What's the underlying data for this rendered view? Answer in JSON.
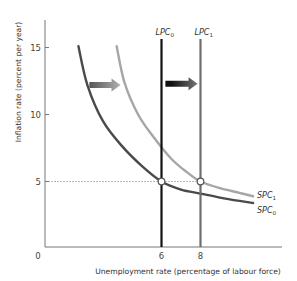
{
  "chart_data": {
    "type": "line",
    "title": "",
    "xlabel": "Unemployment rate (percentage of labour force)",
    "ylabel": "Inflation rate (percent per year)",
    "xlim": [
      0,
      12.2
    ],
    "ylim": [
      0,
      17.1
    ],
    "origin_label": "0",
    "x_ticks": [
      {
        "value": 6,
        "label": "6"
      },
      {
        "value": 8,
        "label": "8"
      }
    ],
    "y_ticks": [
      {
        "value": 5,
        "label": "5"
      },
      {
        "value": 10,
        "label": "10"
      },
      {
        "value": 15,
        "label": "15"
      }
    ],
    "grid": false,
    "series": [
      {
        "name": "SPC0",
        "label_main": "SPC",
        "label_sub": "0",
        "kind": "short-run phillips curve",
        "color": "#4a4a4a",
        "points": [
          [
            1.74,
            15.1
          ],
          [
            2.2,
            12.2
          ],
          [
            3.0,
            9.5
          ],
          [
            4.0,
            7.6
          ],
          [
            5.0,
            6.15
          ],
          [
            6.0,
            5.0
          ],
          [
            7.0,
            4.4
          ],
          [
            8.0,
            4.1
          ],
          [
            9.0,
            3.8
          ],
          [
            10.0,
            3.55
          ],
          [
            10.7,
            3.4
          ]
        ]
      },
      {
        "name": "SPC1",
        "label_main": "SPC",
        "label_sub": "1",
        "kind": "short-run phillips curve",
        "color": "#a6a6a6",
        "points": [
          [
            3.7,
            15.1
          ],
          [
            4.1,
            12.4
          ],
          [
            4.8,
            10.0
          ],
          [
            5.6,
            8.3
          ],
          [
            6.5,
            6.7
          ],
          [
            7.3,
            5.7
          ],
          [
            8.0,
            5.0
          ],
          [
            9.0,
            4.5
          ],
          [
            10.0,
            4.15
          ],
          [
            10.7,
            3.9
          ]
        ]
      },
      {
        "name": "LPC0",
        "label_main": "LPC",
        "label_sub": "0",
        "kind": "long-run phillips curve",
        "color": "#111111",
        "x": 6
      },
      {
        "name": "LPC1",
        "label_main": "LPC",
        "label_sub": "1",
        "kind": "long-run phillips curve",
        "color": "#6e6e6e",
        "x": 8
      }
    ],
    "reference_lines": [
      {
        "type": "horizontal-dotted",
        "y": 5,
        "x_from": 0,
        "x_to": 8
      }
    ],
    "markers": [
      {
        "name": "equilibrium-0",
        "x": 6,
        "y": 5
      },
      {
        "name": "equilibrium-1",
        "x": 8,
        "y": 5
      }
    ],
    "annotations": [
      {
        "type": "shift-arrow",
        "target": "SPC",
        "from_x": 2.3,
        "to_x": 3.9,
        "y": 12.2,
        "color_from": "#555555",
        "color_to": "#b0b0b0"
      },
      {
        "type": "shift-arrow",
        "target": "LPC",
        "from_x": 6.2,
        "to_x": 7.85,
        "y": 12.3,
        "color_from": "#111111",
        "color_to": "#777777"
      }
    ]
  }
}
